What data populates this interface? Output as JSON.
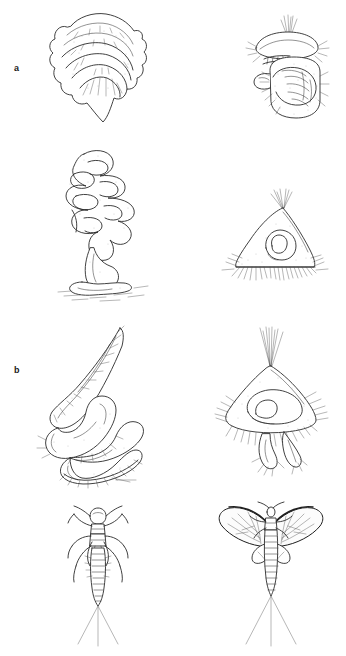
{
  "figure": {
    "background_color": "#ffffff",
    "ink_color": "#2b2b2b",
    "width": 346,
    "height": 656,
    "panel_count": 8,
    "row_count": 4,
    "column_labels": [
      "left",
      "right"
    ]
  },
  "rows": [
    {
      "id": "a",
      "label": "a",
      "left": {
        "name": "bivalve-shell-illustration",
        "subject": "bivalve mollusc shell with concentric growth ridges",
        "view": "exterior valve"
      },
      "right": {
        "name": "capped-larva-illustration",
        "subject": "larva with domed cap and apical bristle tuft",
        "view": "lateral"
      }
    },
    {
      "id": "b",
      "label": "b",
      "left": {
        "name": "branching-colony-illustration",
        "subject": "branching stalked colony on substrate",
        "view": "whole colony"
      },
      "right": {
        "name": "domed-case-illustration",
        "subject": "domed case with marginal setae fringe and apical tuft",
        "view": "lateral"
      }
    },
    {
      "id": "c",
      "label": "c",
      "left": {
        "name": "coiled-worm-illustration",
        "subject": "coiled tapering worm-like body with bristles",
        "view": "whole body"
      },
      "right": {
        "name": "conical-case-illustration",
        "subject": "conical body with setae fringe and apical bristle tuft",
        "view": "lateral"
      }
    },
    {
      "id": "d",
      "label": "d",
      "left": {
        "name": "mayfly-nymph-illustration",
        "subject": "aquatic nymph with six legs and three caudal filaments",
        "view": "dorsal"
      },
      "right": {
        "name": "winged-adult-illustration",
        "subject": "winged adult with spread forewings and three caudal filaments",
        "view": "dorsal"
      }
    }
  ]
}
